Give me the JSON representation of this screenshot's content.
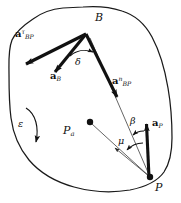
{
  "figure": {
    "stroke_color": "#111111",
    "background_color": "#ffffff",
    "thin_line_color": "#333333"
  },
  "points": [
    {
      "id": "B",
      "label": "B",
      "x": 86,
      "y": 34,
      "label_x": 96,
      "label_y": 16,
      "has_dot": false
    },
    {
      "id": "P",
      "label": "P",
      "x": 150,
      "y": 178,
      "label_x": 154,
      "label_y": 184,
      "has_dot": true
    },
    {
      "id": "Pa",
      "label": "P",
      "sub": "a",
      "x": 88,
      "y": 122,
      "label_x": 64,
      "label_y": 130,
      "has_dot": true
    }
  ],
  "vectors": [
    {
      "id": "a_BP_tau",
      "label_main": "a",
      "label_sup": "τ",
      "label_sub": "BP",
      "from_x": 86,
      "from_y": 34,
      "to_x": 22,
      "to_y": 66,
      "label_x": 20,
      "label_y": 35,
      "weight": "bold"
    },
    {
      "id": "a_B",
      "label_main": "a",
      "label_sup": "",
      "label_sub": "B",
      "from_x": 86,
      "from_y": 34,
      "to_x": 52,
      "to_y": 76,
      "label_x": 53,
      "label_y": 78,
      "weight": "bold"
    },
    {
      "id": "a_BP_n",
      "label_main": "a",
      "label_sup": "n",
      "label_sub": "BP",
      "from_x": 86,
      "from_y": 34,
      "to_x": 119,
      "to_y": 101,
      "label_x": 116,
      "label_y": 82,
      "weight": "bold"
    },
    {
      "id": "a_P",
      "label_main": "a",
      "label_sup": "",
      "label_sub": "P",
      "from_x": 149,
      "from_y": 177,
      "to_x": 146,
      "to_y": 120,
      "label_x": 152,
      "label_y": 122,
      "weight": "bold"
    }
  ],
  "angles": [
    {
      "id": "delta",
      "label": "δ",
      "label_x": 76,
      "label_y": 57,
      "vertex": "B"
    },
    {
      "id": "beta",
      "label": "β",
      "label_x": 131,
      "label_y": 119,
      "vertex": "P"
    },
    {
      "id": "mu",
      "label": "μ",
      "label_x": 119,
      "label_y": 140,
      "vertex": "P"
    }
  ],
  "angular_acceleration": {
    "id": "epsilon",
    "label": "ε",
    "label_x": 21,
    "label_y": 124,
    "arrow_direction": "clockwise-down"
  },
  "thin_lines": [
    {
      "id": "line-P-to-B",
      "from_x": 150,
      "from_y": 177,
      "to_x": 90,
      "to_y": 38
    },
    {
      "id": "line-P-to-Pa",
      "from_x": 150,
      "from_y": 177,
      "to_x": 90,
      "to_y": 123
    },
    {
      "id": "line-P-to-mu-arrow",
      "from_x": 150,
      "from_y": 177,
      "to_x": 113,
      "to_y": 147
    }
  ]
}
